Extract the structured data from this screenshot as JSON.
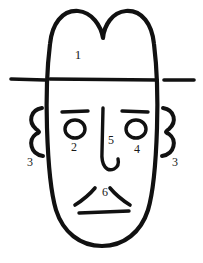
{
  "figure": {
    "ink_color": "#111111",
    "background_color": "#ffffff",
    "width": 203,
    "height": 263
  },
  "labels": [
    {
      "id": "forehead",
      "text": "1",
      "x": 78,
      "y": 56
    },
    {
      "id": "left-eye",
      "text": "2",
      "x": 74,
      "y": 148
    },
    {
      "id": "left-ear",
      "text": "3",
      "x": 30,
      "y": 163
    },
    {
      "id": "right-eye",
      "text": "4",
      "x": 137,
      "y": 150
    },
    {
      "id": "nose",
      "text": "5",
      "x": 111,
      "y": 141
    },
    {
      "id": "right-ear",
      "text": "3",
      "x": 175,
      "y": 163
    },
    {
      "id": "mouth",
      "text": "6",
      "x": 105,
      "y": 193
    }
  ],
  "strokes": {
    "face_outline": "M 103 38 C 101 26 92 12 78 11 C 62 10 52 24 50 44 C 47 68 46 96 47 128 C 48 160 50 190 56 210 C 63 232 80 246 102 246 C 124 246 141 232 148 210 C 154 190 156 160 157 128 C 158 96 157 68 154 44 C 152 24 142 10 126 11 C 112 12 104 26 103 38 Z",
    "brow_line_center": "M 50 79 L 157 80",
    "brow_dash_left": "M 11 79 L 45 80",
    "brow_dash_right": "M 164 80 L 194 80",
    "eyebrow_left": "M 62 112 L 88 111",
    "eyebrow_right": "M 122 111 L 148 112",
    "eye_left": {
      "cx": 75,
      "cy": 129,
      "rx": 10,
      "ry": 9
    },
    "eye_right": {
      "cx": 136,
      "cy": 129,
      "rx": 10,
      "ry": 9
    },
    "nose": "M 103 108 L 102 152 C 101 166 107 172 114 169 C 118 167 119 163 118 159",
    "ear_left": "M 42 108 C 30 110 28 122 36 129 C 40 132 40 132 36 134 C 28 140 30 154 43 156",
    "ear_right": "M 163 108 C 175 110 177 122 169 129 C 165 132 165 132 169 134 C 177 140 175 154 162 156",
    "mustache_left": "M 75 205 C 83 200 90 194 95 188",
    "mustache_right": "M 130 205 C 122 200 115 194 110 188",
    "mouth": "M 79 213 L 129 211"
  }
}
